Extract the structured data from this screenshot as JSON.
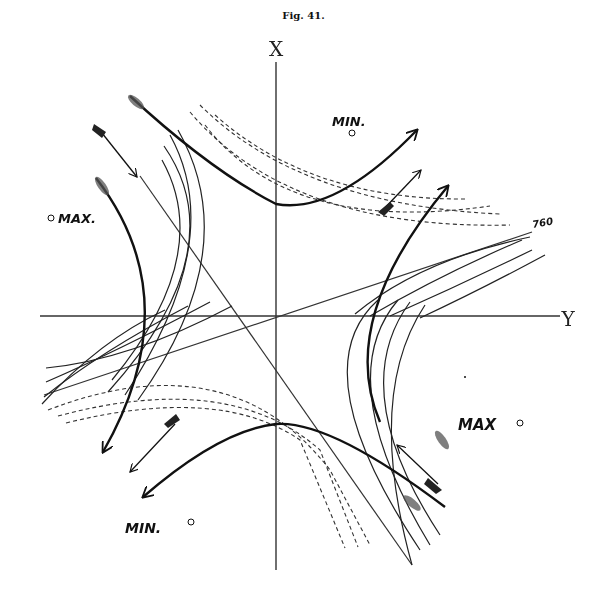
{
  "figure": {
    "caption": "Fig. 41.",
    "axis_x_label": "X",
    "axis_y_label": "Y",
    "isobar_label": "760",
    "labels": {
      "min_top": "MIN.",
      "max_left": "MAX.",
      "max_right": "MAX",
      "min_bottom": "MIN."
    },
    "colors": {
      "ink": "#111111",
      "paper": "#ffffff"
    }
  }
}
